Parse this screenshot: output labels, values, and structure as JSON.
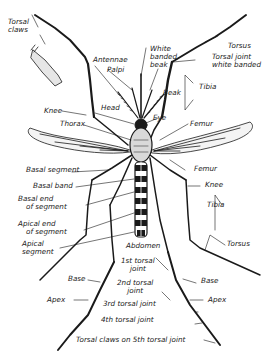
{
  "diagram": {
    "colors": {
      "ink": "#1a1a1a",
      "background": "#ffffff",
      "wing_fill": "#f4f4f4",
      "scale_fill": "#d9d9d9"
    },
    "labels": {
      "tarsal_claws": {
        "l1": "Torsal",
        "l2": "claws"
      },
      "antennae": "Antennae",
      "palpi": "Palpi",
      "white_banded_beak": {
        "l1": "White",
        "l2": "banded",
        "l3": "beak"
      },
      "beak": "Beak",
      "torsus_top": "Torsus",
      "tarsal_joint_white_banded": {
        "l1": "Torsal joint",
        "l2": "white banded"
      },
      "tibia_top": "Tibia",
      "knee_left": "Knee",
      "head": "Head",
      "eye": "Eye",
      "thorax": "Thorax",
      "femur_top": "Femur",
      "basal_segment": "Basal segment",
      "femur_right": "Femur",
      "knee_right": "Knee",
      "basal_band": "Basal band",
      "basal_end": {
        "l1": "Basal end",
        "l2": "of segment"
      },
      "tibia_right": "Tibia",
      "apical_end": {
        "l1": "Apical end",
        "l2": "of segment"
      },
      "apical_segment": {
        "l1": "Apical",
        "l2": "segment"
      },
      "abdomen": "Abdomen",
      "torsus_right": "Torsus",
      "first_tarsal_joint": {
        "l1": "1st torsal",
        "l2": "joint"
      },
      "base_left": "Base",
      "base_right": "Base",
      "second_tarsal_joint": {
        "l1": "2nd torsal",
        "l2": "joint"
      },
      "apex_left": "Apex",
      "apex_right": "Apex",
      "third_tarsal_joint": "3rd torsal joint",
      "fourth_tarsal_joint": "4th torsal joint",
      "tarsal_claws_5th": "Torsal claws on 5th torsal joint"
    }
  }
}
